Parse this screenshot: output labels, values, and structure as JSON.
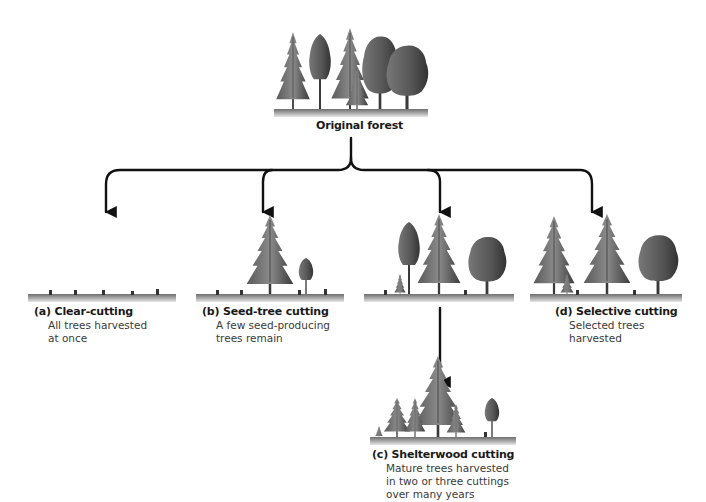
{
  "figure": {
    "root": {
      "label": "Original forest"
    },
    "methods": [
      {
        "id": "a",
        "title": "(a) Clear-cutting",
        "description_lines": [
          "All trees harvested",
          "at once"
        ]
      },
      {
        "id": "b",
        "title": "(b) Seed-tree cutting",
        "description_lines": [
          "A few seed-producing",
          "trees remain"
        ]
      },
      {
        "id": "c",
        "title": "(c) Shelterwood cutting",
        "description_lines": [
          "Mature trees harvested",
          "in two or three cuttings",
          "over many years"
        ]
      },
      {
        "id": "d",
        "title": "(d) Selective cutting",
        "description_lines": [
          "Selected trees",
          "harvested"
        ]
      }
    ]
  },
  "colors": {
    "arrow": "#111111",
    "ground": "#8a8a8a",
    "tree_dark": "#3d3d3d",
    "tree_mid": "#6b6b6b",
    "tree_light": "#9a9a9a"
  }
}
